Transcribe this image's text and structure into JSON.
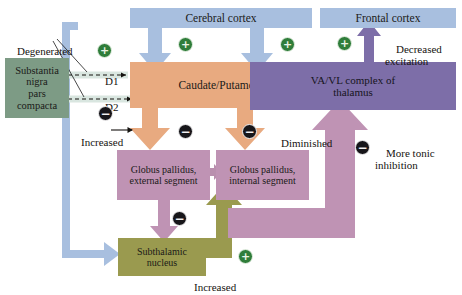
{
  "diagram": {
    "colors": {
      "cortex_blue": "#a8bfdf",
      "cortex_blue_arrow": "#9fb9dd",
      "striatum_orange": "#e8aa80",
      "pallidum_mauve": "#bf93b4",
      "thalamus_purple": "#7d6ea8",
      "thalamus_arrow": "#b691bd",
      "subthalamic_olive": "#9a9a4f",
      "nigra_green": "#7d9b85",
      "plus_green": "#2f7d3a",
      "minus_black": "#17161a"
    }
  },
  "boxes": {
    "cerebral_cortex": "Cerebral cortex",
    "frontal_cortex": "Frontal cortex",
    "substantia_nigra": "Substantia\nnigra\npars\ncompacta",
    "caudate_putamen": "Caudate/Putamen",
    "globus_pallidus_external": "Globus pallidus,\nexternal segment",
    "globus_pallidus_internal": "Globus pallidus,\ninternal segment",
    "thalamus": "VA/VL complex of\nthalamus",
    "subthalamic_nucleus": "Subthalamic\nnucleus"
  },
  "labels": {
    "degenerated": "Degenerated",
    "d1": "D1",
    "d2": "D2",
    "increased_left": "Increased",
    "diminished": "Diminished",
    "decreased_excitation": "Decreased\nexcitation",
    "more_tonic_inhibition": "More tonic\ninhibition",
    "increased_bottom": "Increased"
  },
  "signs": {
    "plus": "+",
    "minus": "−",
    "plus_d1_cortex": "+",
    "plus_cortex_striatum_mid": "+",
    "plus_cortex_striatum_right": "+",
    "minus_d2": "−",
    "minus_striatum_gpe": "−",
    "minus_striatum_gpi": "−",
    "minus_gpe_stn": "−",
    "minus_gpi_thalamus": "−",
    "plus_stn_gpi": "+",
    "plus_thalamus_cortex": "+"
  }
}
